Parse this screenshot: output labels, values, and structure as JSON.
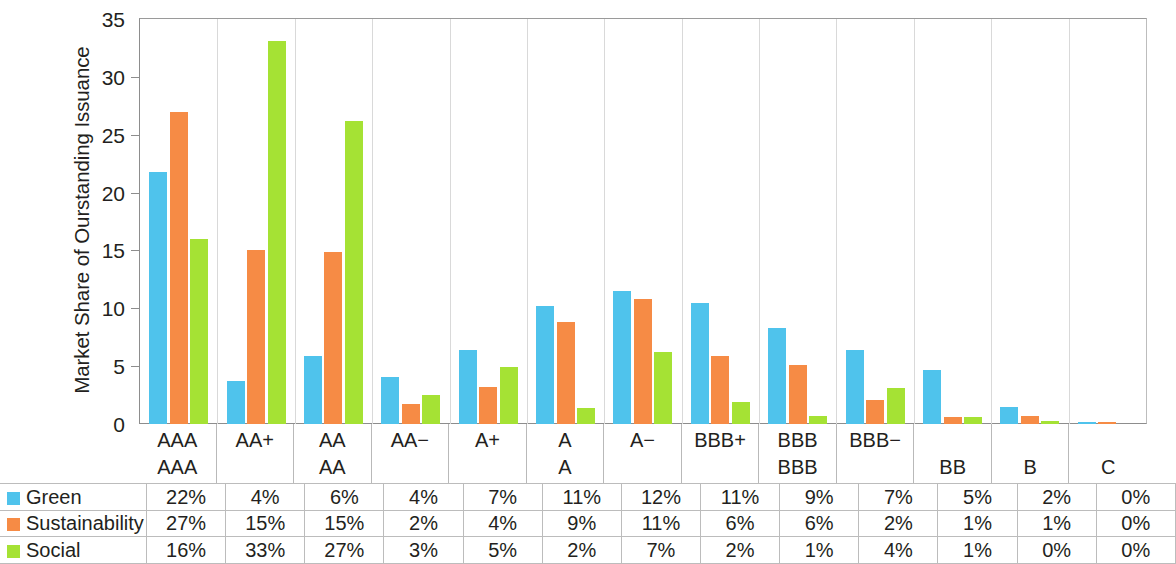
{
  "chart_data": {
    "type": "bar",
    "title": "",
    "subtitle": "",
    "xlabel": "",
    "ylabel": "Market Share of Ourstanding Issuance",
    "ylim": [
      0,
      35
    ],
    "yticks": [
      0,
      5,
      10,
      15,
      20,
      25,
      30,
      35
    ],
    "grid": false,
    "legend_position": "table-row-labels",
    "categories": [
      "AAA / AAA",
      "AA+",
      "AA / AA",
      "AA−",
      "A+",
      "A / A",
      "A−",
      "BBB+",
      "BBB / BBB",
      "BBB−",
      "BB",
      "B",
      "C"
    ],
    "category_lines": [
      [
        "AAA",
        "AAA"
      ],
      [
        "AA+",
        ""
      ],
      [
        "AA",
        "AA"
      ],
      [
        "AA−",
        ""
      ],
      [
        "A+",
        ""
      ],
      [
        "A",
        "A"
      ],
      [
        "A−",
        ""
      ],
      [
        "BBB+",
        ""
      ],
      [
        "BBB",
        "BBB"
      ],
      [
        "BBB−",
        ""
      ],
      [
        "",
        "BB"
      ],
      [
        "",
        "B"
      ],
      [
        "",
        "C"
      ]
    ],
    "series": [
      {
        "name": "Green",
        "color": "#4FC3EC",
        "values": [
          21.8,
          3.7,
          5.9,
          4.1,
          6.4,
          10.2,
          11.5,
          10.5,
          8.3,
          6.4,
          4.7,
          1.5,
          0.15
        ],
        "labels": [
          "22%",
          "4%",
          "6%",
          "4%",
          "7%",
          "11%",
          "12%",
          "11%",
          "9%",
          "7%",
          "5%",
          "2%",
          "0%"
        ]
      },
      {
        "name": "Sustainability",
        "color": "#F68B45",
        "values": [
          27.0,
          15.0,
          14.9,
          1.7,
          3.2,
          8.8,
          10.8,
          5.9,
          5.1,
          2.1,
          0.6,
          0.7,
          0.2
        ],
        "labels": [
          "27%",
          "15%",
          "15%",
          "2%",
          "4%",
          "9%",
          "11%",
          "6%",
          "6%",
          "2%",
          "1%",
          "1%",
          "0%"
        ]
      },
      {
        "name": "Social",
        "color": "#A5E234",
        "values": [
          16.0,
          33.1,
          26.2,
          2.5,
          4.9,
          1.4,
          6.2,
          1.9,
          0.7,
          3.1,
          0.6,
          0.25,
          0.0
        ],
        "labels": [
          "16%",
          "33%",
          "27%",
          "3%",
          "5%",
          "2%",
          "7%",
          "2%",
          "1%",
          "4%",
          "1%",
          "0%",
          "0%"
        ]
      }
    ]
  },
  "table": {
    "rows": [
      {
        "name": "Green",
        "color": "#4FC3EC",
        "cells": [
          "22%",
          "4%",
          "6%",
          "4%",
          "7%",
          "11%",
          "12%",
          "11%",
          "9%",
          "7%",
          "5%",
          "2%",
          "0%"
        ]
      },
      {
        "name": "Sustainability",
        "color": "#F68B45",
        "cells": [
          "27%",
          "15%",
          "15%",
          "2%",
          "4%",
          "9%",
          "11%",
          "6%",
          "6%",
          "2%",
          "1%",
          "1%",
          "0%"
        ]
      },
      {
        "name": "Social",
        "color": "#A5E234",
        "cells": [
          "16%",
          "33%",
          "27%",
          "3%",
          "5%",
          "2%",
          "7%",
          "2%",
          "1%",
          "4%",
          "1%",
          "0%",
          "0%"
        ]
      }
    ]
  }
}
